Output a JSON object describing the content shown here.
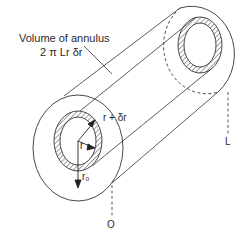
{
  "diagram": {
    "labels": {
      "annulus_line1": "Volume of annulus",
      "annulus_line2": "2 π Lr δr",
      "r_plus_dr": "r + δr",
      "r": "r",
      "r0": "r₀",
      "length": "L",
      "origin": "O"
    },
    "colors": {
      "stroke": "#333333",
      "hatch": "#444444",
      "background": "#ffffff"
    }
  }
}
